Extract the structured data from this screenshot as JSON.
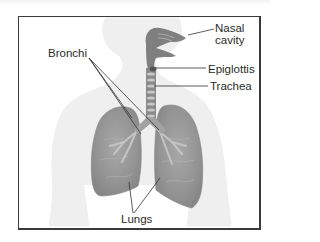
{
  "diagram": {
    "labels": {
      "nasal_cavity_line1": "Nasal",
      "nasal_cavity_line2": "cavity",
      "epiglottis": "Epiglottis",
      "trachea": "Trachea",
      "bronchi": "Bronchi",
      "lungs": "Lungs"
    },
    "colors": {
      "frame_border": "#3a3a3a",
      "body_silhouette": "#eeeeee",
      "airway": "#7f7f7f",
      "lung_fill": "#9a9a9a",
      "leader_line": "#333333",
      "label_text": "#2b2b2b"
    }
  }
}
